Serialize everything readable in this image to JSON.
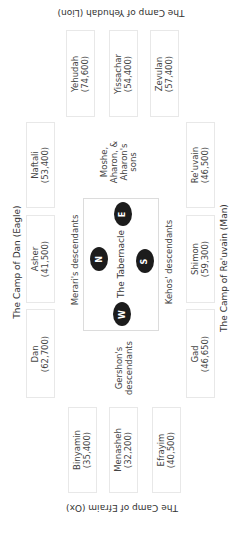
{
  "camps": {
    "north": {
      "label": "The Camp of Dan (Eagle)"
    },
    "east": {
      "label": "The Camp of Yehudah (Lion)"
    },
    "south": {
      "label": "The Camp of Re'uvain (Man)"
    },
    "west": {
      "label": "The Camp of Efraim (Ox)"
    }
  },
  "tribes": {
    "yehudah": {
      "name": "Yehudah",
      "count": "(74,600)"
    },
    "yissachar": {
      "name": "Yissachar",
      "count": "(54,400)"
    },
    "zevulan": {
      "name": "Zevulan",
      "count": "(57,400)"
    },
    "naftali": {
      "name": "Naftali",
      "count": "(53,400)"
    },
    "asher": {
      "name": "Asher",
      "count": "(41,500)"
    },
    "dan": {
      "name": "Dan",
      "count": "(62,700)"
    },
    "reuvain": {
      "name": "Re'uvain",
      "count": "(46,500)"
    },
    "shimon": {
      "name": "Shimon",
      "count": "(59,300)"
    },
    "gad": {
      "name": "Gad",
      "count": "(46,650)"
    },
    "binyamin": {
      "name": "Binyamin",
      "count": "(35,400)"
    },
    "menasheh": {
      "name": "Menasheh",
      "count": "(32,200)"
    },
    "efrayim": {
      "name": "Efrayim",
      "count": "(40,500)"
    }
  },
  "levites": {
    "east": {
      "line1": "Moshe,",
      "line2": "Aharon, &",
      "line3": "Aharon's",
      "line4": "sons"
    },
    "north": {
      "label": "Merari's descendants"
    },
    "south": {
      "label": "Kehos' descendants"
    },
    "west": {
      "line1": "Gershon's",
      "line2": "descendants"
    }
  },
  "tabernacle": {
    "label": "The Tabernacle",
    "directions": {
      "east": "E",
      "north": "N",
      "south": "S",
      "west": "W"
    }
  }
}
